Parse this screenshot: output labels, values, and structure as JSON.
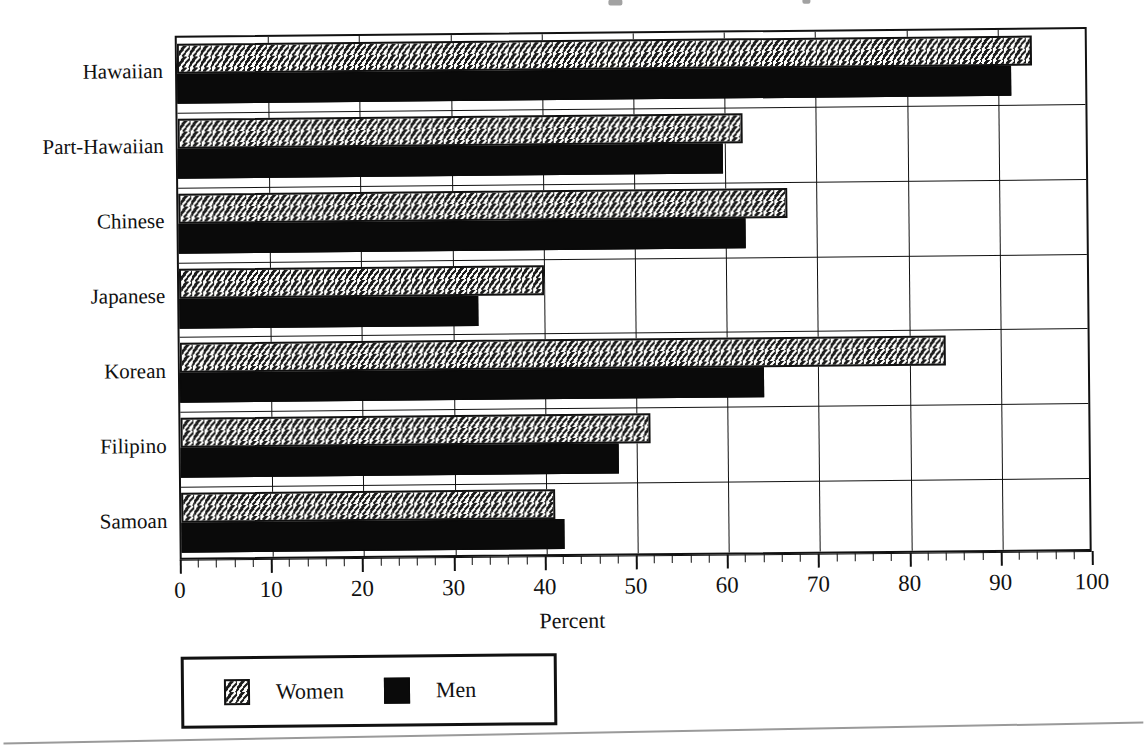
{
  "chart_data": {
    "type": "bar",
    "orientation": "horizontal",
    "title": "",
    "xlabel": "Percent",
    "ylabel": "",
    "xlim": [
      0,
      100
    ],
    "xticks": [
      "0",
      "10",
      "20",
      "30",
      "40",
      "50",
      "60",
      "70",
      "80",
      "90",
      "100"
    ],
    "minor_tick_step": 2,
    "grid": "vertical",
    "legend_position": "below-axis-left",
    "categories": [
      "Hawaiian",
      "Part-Hawaiian",
      "Chinese",
      "Japanese",
      "Korean",
      "Filipino",
      "Samoan"
    ],
    "series": [
      {
        "name": "Women",
        "pattern": "dotted-hatch",
        "values": [
          93.7,
          62.0,
          66.8,
          40.0,
          84.0,
          51.5,
          41.0
        ]
      },
      {
        "name": "Men",
        "pattern": "solid-black",
        "values": [
          91.5,
          59.8,
          62.2,
          32.8,
          64.0,
          48.0,
          42.0
        ]
      }
    ]
  },
  "axis": {
    "x_title": "Percent",
    "ticks": [
      {
        "label": "0",
        "value": 0
      },
      {
        "label": "10",
        "value": 10
      },
      {
        "label": "20",
        "value": 20
      },
      {
        "label": "30",
        "value": 30
      },
      {
        "label": "40",
        "value": 40
      },
      {
        "label": "50",
        "value": 50
      },
      {
        "label": "60",
        "value": 60
      },
      {
        "label": "70",
        "value": 70
      },
      {
        "label": "80",
        "value": 80
      },
      {
        "label": "90",
        "value": 90
      },
      {
        "label": "100",
        "value": 100
      }
    ]
  },
  "legend": {
    "items": [
      {
        "label": "Women",
        "swatch": "dotted-hatch-swatch"
      },
      {
        "label": "Men",
        "swatch": "solid-black-swatch"
      }
    ]
  },
  "colors": {
    "ink": "#111111",
    "men_fill": "#0a0a0a",
    "women_fill": "#fdfdfb",
    "page": "#ffffff",
    "rule": "#9a9a9a"
  }
}
